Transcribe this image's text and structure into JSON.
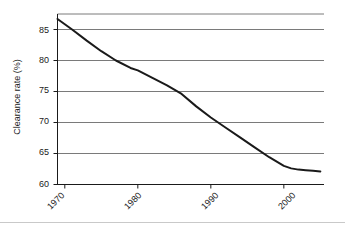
{
  "chart_data": {
    "type": "line",
    "title": "",
    "xlabel": "",
    "ylabel": "Clearance rate (%)",
    "xlim": [
      1969,
      2005.5
    ],
    "ylim": [
      60,
      87.5
    ],
    "grid": true,
    "legend": "none",
    "xticks": [
      1970,
      1980,
      1990,
      2000
    ],
    "xtick_labels": [
      "1970",
      "1980",
      "1990",
      "2000"
    ],
    "yticks": [
      60,
      65,
      70,
      75,
      80,
      85
    ],
    "ytick_labels": [
      "60",
      "65",
      "70",
      "75",
      "80",
      "85"
    ],
    "gridlines_y": [
      65,
      70,
      75,
      80,
      85,
      87.5
    ],
    "series": [
      {
        "name": "Clearance rate",
        "color": "#1a1a1a",
        "x": [
          1969,
          1971,
          1973,
          1975,
          1977,
          1979,
          1980,
          1982,
          1984,
          1986,
          1988,
          1990,
          1992,
          1994,
          1996,
          1998,
          2000,
          2001,
          2002,
          2003,
          2004,
          2005
        ],
        "y": [
          86.7,
          85.0,
          83.2,
          81.5,
          80.0,
          78.8,
          78.4,
          77.2,
          76.0,
          74.6,
          72.6,
          70.8,
          69.2,
          67.6,
          66.0,
          64.4,
          63.0,
          62.6,
          62.4,
          62.3,
          62.2,
          62.1
        ]
      }
    ]
  },
  "axes": {
    "ylabel_text": "Clearance rate (%)"
  }
}
